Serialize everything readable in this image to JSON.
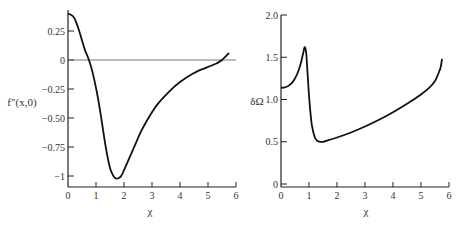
{
  "chart_data": [
    {
      "type": "line",
      "title": "",
      "xlabel": "χ",
      "ylabel": "f″(x,0)",
      "xlim": [
        0,
        6
      ],
      "ylim": [
        -1.05,
        0.42
      ],
      "xticks": [
        0,
        1,
        2,
        3,
        4,
        5,
        6
      ],
      "xtick_labels": [
        "0",
        "1",
        "2",
        "3",
        "4",
        "5",
        "6"
      ],
      "yticks": [
        0.25,
        0,
        -0.25,
        -0.5,
        -0.75,
        -1
      ],
      "ytick_labels": [
        "0.25",
        "0",
        "−0.25",
        "−0.50",
        "−0.75",
        "−1"
      ],
      "grid": false,
      "reference_line": {
        "y": 0
      },
      "series": [
        {
          "name": "f″(x,0)",
          "x": [
            0,
            0.1,
            0.2,
            0.3,
            0.4,
            0.5,
            0.6,
            0.7,
            0.8,
            0.9,
            1.0,
            1.1,
            1.2,
            1.3,
            1.4,
            1.5,
            1.6,
            1.7,
            1.8,
            1.9,
            2.0,
            2.2,
            2.4,
            2.6,
            2.8,
            3.0,
            3.2,
            3.5,
            3.8,
            4.0,
            4.3,
            4.6,
            5.0,
            5.3,
            5.5,
            5.75
          ],
          "values": [
            0.4,
            0.39,
            0.37,
            0.32,
            0.25,
            0.17,
            0.09,
            0.03,
            -0.04,
            -0.13,
            -0.24,
            -0.37,
            -0.52,
            -0.68,
            -0.82,
            -0.93,
            -0.99,
            -1.02,
            -1.02,
            -1.0,
            -0.95,
            -0.84,
            -0.73,
            -0.62,
            -0.53,
            -0.45,
            -0.38,
            -0.3,
            -0.23,
            -0.19,
            -0.14,
            -0.1,
            -0.06,
            -0.03,
            0.0,
            0.06
          ]
        }
      ]
    },
    {
      "type": "line",
      "title": "",
      "xlabel": "χ",
      "ylabel": "δΩ",
      "xlim": [
        0,
        6
      ],
      "ylim": [
        0,
        2.0
      ],
      "xticks": [
        0,
        1,
        2,
        3,
        4,
        5,
        6
      ],
      "xtick_labels": [
        "0",
        "1",
        "2",
        "3",
        "4",
        "5",
        "6"
      ],
      "yticks": [
        0,
        0.5,
        1.0,
        1.5,
        2.0
      ],
      "ytick_labels": [
        "0",
        "0.5",
        "1.0",
        "1.5",
        "2.0"
      ],
      "grid": false,
      "series": [
        {
          "name": "δΩ",
          "x": [
            0,
            0.1,
            0.2,
            0.3,
            0.4,
            0.5,
            0.6,
            0.7,
            0.8,
            0.85,
            0.9,
            0.95,
            1.0,
            1.05,
            1.1,
            1.2,
            1.3,
            1.4,
            1.5,
            1.7,
            2.0,
            2.5,
            3.0,
            3.5,
            4.0,
            4.5,
            5.0,
            5.3,
            5.5,
            5.6,
            5.7,
            5.75
          ],
          "values": [
            1.14,
            1.14,
            1.15,
            1.17,
            1.2,
            1.25,
            1.32,
            1.42,
            1.56,
            1.62,
            1.55,
            1.3,
            1.05,
            0.85,
            0.7,
            0.56,
            0.51,
            0.5,
            0.5,
            0.52,
            0.55,
            0.61,
            0.68,
            0.76,
            0.85,
            0.95,
            1.06,
            1.14,
            1.22,
            1.29,
            1.38,
            1.48
          ]
        }
      ]
    }
  ],
  "caption": "…"
}
